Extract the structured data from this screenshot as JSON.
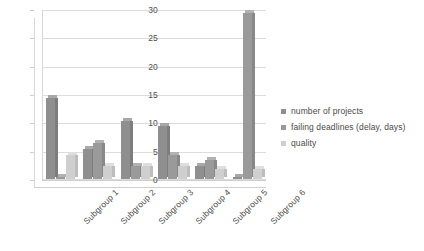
{
  "chart_data": {
    "type": "bar",
    "title": "",
    "xlabel": "",
    "ylabel": "",
    "categories": [
      "Subgroup 1",
      "Subgroup 2",
      "Subgroup 3",
      "Subgroup 4",
      "Subgroup 5",
      "Subgroup 6"
    ],
    "series": [
      {
        "name": "number of projects",
        "color": "#8f8f8f",
        "values": [
          15,
          6,
          11,
          10,
          3,
          1
        ]
      },
      {
        "name": "failing deadlines (delay, days)",
        "color": "#9a9a9a",
        "values": [
          1,
          7,
          3,
          5,
          4,
          30
        ]
      },
      {
        "name": "quality",
        "color": "#cfcfcf",
        "values": [
          5,
          3,
          3,
          3,
          2.5,
          2.5
        ]
      }
    ],
    "ylim": [
      0,
      30
    ],
    "yticks": [
      0,
      5,
      10,
      15,
      20,
      25,
      30
    ],
    "ytick_labels": [
      "0",
      "5",
      "10",
      "15",
      "20",
      "25",
      "30"
    ],
    "grid": true,
    "legend_position": "right",
    "style": "3d-column"
  }
}
